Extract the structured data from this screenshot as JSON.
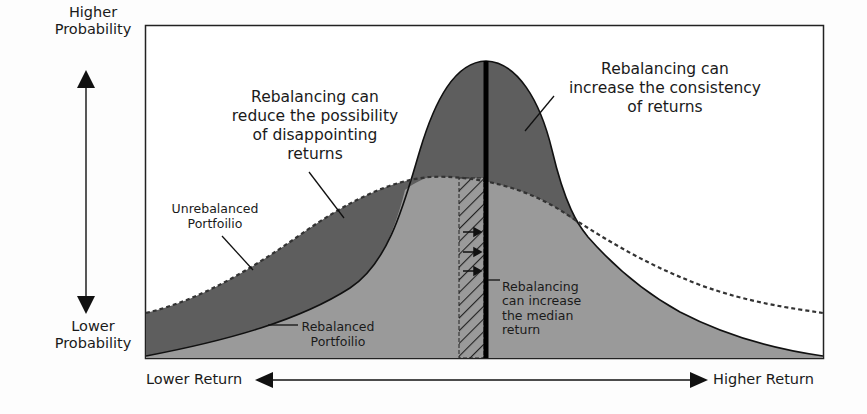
{
  "diagram": {
    "y_axis": {
      "top_label": "Higher Probability",
      "bottom_label": "Lower Probability"
    },
    "x_axis": {
      "left_label": "Lower Return",
      "right_label": "Higher Return"
    },
    "annotations": {
      "reduce_disappointing": "Rebalancing can reduce the possibility of disappointing returns",
      "increase_consistency": "Rebalancing can increase the consistency of returns",
      "unrebalanced_label": "Unrebalanced Portfoilio",
      "rebalanced_label": "Rebalanced Portfoilio",
      "median_label": "Rebalancing can increase the median return"
    },
    "lines": {
      "reduce_disappointing_1": "Rebalancing can",
      "reduce_disappointing_2": "reduce the possibility",
      "reduce_disappointing_3": "of disappointing",
      "reduce_disappointing_4": "returns",
      "consistency_1": "Rebalancing can",
      "consistency_2": "increase the consistency",
      "consistency_3": "of returns",
      "unreb_1": "Unrebalanced",
      "unreb_2": "Portfoilio",
      "reb_1": "Rebalanced",
      "reb_2": "Portfoilio",
      "median_1": "Rebalancing",
      "median_2": "can increase",
      "median_3": "the median",
      "median_4": "return",
      "y_top_1": "Higher",
      "y_top_2": "Probability",
      "y_bot_1": "Lower",
      "y_bot_2": "Probability"
    },
    "colors": {
      "dark_fill": "#5e5e5e",
      "light_fill": "#9a9a9a",
      "outline": "#111111",
      "background": "#fdfdfd"
    },
    "series": [
      {
        "name": "Rebalanced Portfolio",
        "style": "solid",
        "shape": "tall narrow bell, peak at median"
      },
      {
        "name": "Unrebalanced Portfolio",
        "style": "dashed",
        "shape": "wide flat bell, fat tails"
      }
    ]
  }
}
